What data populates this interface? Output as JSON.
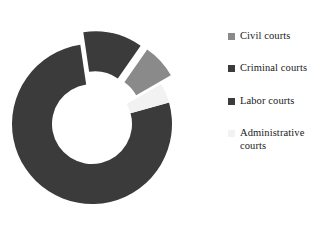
{
  "chart_data": {
    "type": "pie",
    "variant": "donut",
    "title": "",
    "subtitle": "",
    "xlabel": "",
    "ylabel": "",
    "hole_ratio": 0.5,
    "legend_position": "right",
    "grid": false,
    "start_angle_deg": 30,
    "direction": "counterclockwise",
    "categories": [
      "Civil courts",
      "Criminal courts",
      "Labor courts",
      "Administrative courts"
    ],
    "values": [
      7,
      12,
      77,
      4
    ],
    "colors": [
      "#8a8a8a",
      "#3b3b3b",
      "#3b3b3b",
      "#f2f2f2"
    ],
    "exploded": [
      true,
      true,
      false,
      false
    ],
    "slices": [
      {
        "label": "Civil courts",
        "value": 7,
        "color": "#8a8a8a",
        "exploded": true
      },
      {
        "label": "Criminal courts",
        "value": 12,
        "color": "#3b3b3b",
        "exploded": true
      },
      {
        "label": "Labor courts",
        "value": 77,
        "color": "#3b3b3b",
        "exploded": false
      },
      {
        "label": "Administrative courts",
        "value": 4,
        "color": "#f2f2f2",
        "exploded": false
      }
    ]
  },
  "legend": {
    "items": [
      {
        "label": "Civil courts",
        "color": "#8a8a8a"
      },
      {
        "label": "Criminal courts",
        "color": "#3b3b3b"
      },
      {
        "label": "Labor courts",
        "color": "#3b3b3b"
      },
      {
        "label": "Administrative courts",
        "color": "#f2f2f2"
      }
    ]
  },
  "colors": {
    "background": "#ffffff",
    "text": "#1a1a1a",
    "light_gray": "#8a8a8a",
    "dark_gray": "#3b3b3b",
    "near_white": "#f2f2f2"
  }
}
